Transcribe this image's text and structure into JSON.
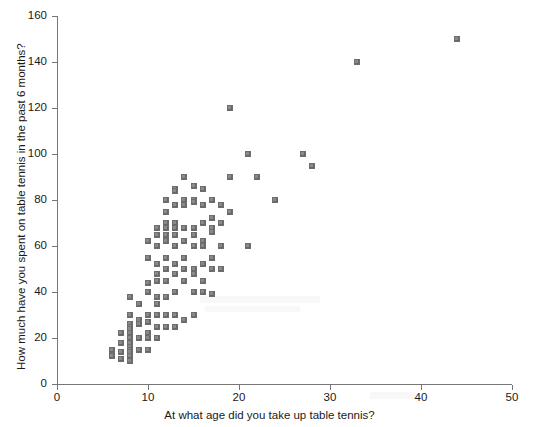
{
  "chart_data": {
    "type": "scatter",
    "title": "",
    "xlabel": "At what age did you take up table tennis?",
    "ylabel": "How much have you spent on table tennis in the past 6 months?",
    "xlim": [
      0,
      50
    ],
    "ylim": [
      0,
      160
    ],
    "xticks": [
      0,
      10,
      20,
      30,
      40,
      50
    ],
    "yticks": [
      0,
      20,
      40,
      60,
      80,
      100,
      120,
      140,
      160
    ],
    "xtick_labels": [
      "0",
      "10",
      "20",
      "30",
      "40",
      "50"
    ],
    "ytick_labels": [
      "0",
      "20",
      "40",
      "60",
      "80",
      "100",
      "120",
      "140",
      "160"
    ],
    "grid": false,
    "legend": false,
    "marker": "square",
    "marker_color": "#8a8a8a",
    "marker_size_px": 6,
    "points": [
      [
        6,
        15
      ],
      [
        6,
        12
      ],
      [
        7,
        22
      ],
      [
        7,
        18
      ],
      [
        7,
        14
      ],
      [
        7,
        11
      ],
      [
        8,
        38
      ],
      [
        8,
        30
      ],
      [
        8,
        26
      ],
      [
        8,
        25
      ],
      [
        8,
        24
      ],
      [
        8,
        22
      ],
      [
        8,
        20
      ],
      [
        8,
        18
      ],
      [
        8,
        16
      ],
      [
        8,
        15
      ],
      [
        8,
        14
      ],
      [
        8,
        12
      ],
      [
        8,
        10
      ],
      [
        9,
        35
      ],
      [
        9,
        28
      ],
      [
        9,
        26
      ],
      [
        9,
        20
      ],
      [
        9,
        15
      ],
      [
        10,
        62
      ],
      [
        10,
        55
      ],
      [
        10,
        44
      ],
      [
        10,
        40
      ],
      [
        10,
        30
      ],
      [
        10,
        27
      ],
      [
        10,
        22
      ],
      [
        10,
        20
      ],
      [
        10,
        15
      ],
      [
        11,
        68
      ],
      [
        11,
        65
      ],
      [
        11,
        60
      ],
      [
        11,
        52
      ],
      [
        11,
        48
      ],
      [
        11,
        45
      ],
      [
        11,
        38
      ],
      [
        11,
        35
      ],
      [
        11,
        30
      ],
      [
        11,
        25
      ],
      [
        11,
        20
      ],
      [
        12,
        80
      ],
      [
        12,
        75
      ],
      [
        12,
        70
      ],
      [
        12,
        68
      ],
      [
        12,
        65
      ],
      [
        12,
        62
      ],
      [
        12,
        55
      ],
      [
        12,
        50
      ],
      [
        12,
        45
      ],
      [
        12,
        38
      ],
      [
        12,
        30
      ],
      [
        12,
        25
      ],
      [
        13,
        85
      ],
      [
        13,
        84
      ],
      [
        13,
        78
      ],
      [
        13,
        70
      ],
      [
        13,
        68
      ],
      [
        13,
        65
      ],
      [
        13,
        60
      ],
      [
        13,
        52
      ],
      [
        13,
        48
      ],
      [
        13,
        40
      ],
      [
        13,
        30
      ],
      [
        13,
        25
      ],
      [
        14,
        90
      ],
      [
        14,
        80
      ],
      [
        14,
        78
      ],
      [
        14,
        68
      ],
      [
        14,
        62
      ],
      [
        14,
        55
      ],
      [
        14,
        50
      ],
      [
        14,
        45
      ],
      [
        14,
        28
      ],
      [
        15,
        86
      ],
      [
        15,
        80
      ],
      [
        15,
        79
      ],
      [
        15,
        68
      ],
      [
        15,
        65
      ],
      [
        15,
        60
      ],
      [
        15,
        50
      ],
      [
        15,
        48
      ],
      [
        15,
        40
      ],
      [
        15,
        30
      ],
      [
        16,
        85
      ],
      [
        16,
        78
      ],
      [
        16,
        70
      ],
      [
        16,
        62
      ],
      [
        16,
        60
      ],
      [
        16,
        52
      ],
      [
        16,
        45
      ],
      [
        16,
        40
      ],
      [
        17,
        80
      ],
      [
        17,
        72
      ],
      [
        17,
        68
      ],
      [
        17,
        66
      ],
      [
        17,
        55
      ],
      [
        17,
        50
      ],
      [
        17,
        39
      ],
      [
        18,
        78
      ],
      [
        18,
        70
      ],
      [
        18,
        60
      ],
      [
        18,
        50
      ],
      [
        19,
        120
      ],
      [
        19,
        90
      ],
      [
        19,
        75
      ],
      [
        21,
        100
      ],
      [
        21,
        60
      ],
      [
        22,
        90
      ],
      [
        24,
        80
      ],
      [
        27,
        100
      ],
      [
        28,
        95
      ],
      [
        33,
        140
      ],
      [
        44,
        150
      ]
    ]
  }
}
